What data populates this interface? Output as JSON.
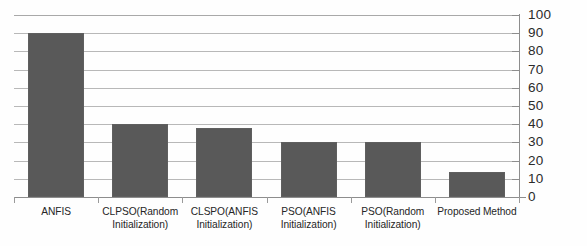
{
  "chart_data": {
    "type": "bar",
    "title": "",
    "subtitle": "",
    "xlabel": "",
    "ylabel": "",
    "categories": [
      "ANFIS",
      "CLPSO(Random Initialization)",
      "CLSPO(ANFIS Initialization)",
      "PSO(ANFIS Initialization)",
      "PSO(Random Initialization)",
      "Proposed Method"
    ],
    "category_lines": [
      [
        "ANFIS"
      ],
      [
        "CLPSO(Random",
        "Initialization)"
      ],
      [
        "CLSPO(ANFIS",
        "Initialization)"
      ],
      [
        "PSO(ANFIS",
        "Initialization)"
      ],
      [
        "PSO(Random",
        "Initialization)"
      ],
      [
        "Proposed Method"
      ]
    ],
    "values": [
      90,
      40,
      38,
      30,
      30,
      14
    ],
    "ylim": [
      0,
      100
    ],
    "ytick_step": 10,
    "yticks": [
      0,
      10,
      20,
      30,
      40,
      50,
      60,
      70,
      80,
      90,
      100
    ],
    "ytick_labels": [
      "0",
      "10",
      "20",
      "30",
      "40",
      "50",
      "60",
      "70",
      "80",
      "90",
      "100"
    ],
    "axis_position": "right",
    "grid": true,
    "legend": false,
    "legend_position": "none",
    "series_name": "",
    "bar_color": "#595959",
    "gridline_color": "#b8b8b8",
    "axis_color": "#8d8d8d",
    "background_color": "#ffffff"
  }
}
